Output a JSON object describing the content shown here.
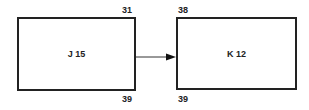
{
  "nodes": [
    {
      "id": "J",
      "label": "J 15",
      "top_right": "31",
      "bottom_right": "39"
    },
    {
      "id": "K",
      "label": "K 12",
      "top_left": "38",
      "bottom_left": "39"
    }
  ],
  "edges": [
    {
      "from": "J",
      "to": "K",
      "type": "arrow"
    }
  ]
}
